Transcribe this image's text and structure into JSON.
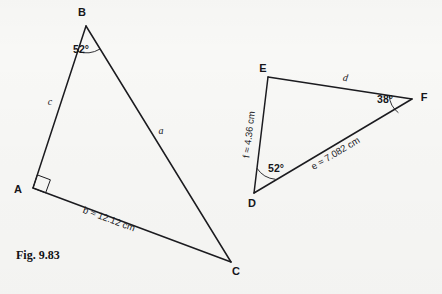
{
  "figure": {
    "caption": "Fig. 9.83",
    "background_color": "#f8f8f6",
    "ink_color": "#1b1b1f"
  },
  "triangle_abc": {
    "name": "triangle-abc",
    "vertices": {
      "A": {
        "label": "A",
        "x": 33,
        "y": 188
      },
      "B": {
        "label": "B",
        "x": 86,
        "y": 26
      },
      "C": {
        "label": "C",
        "x": 231,
        "y": 262
      }
    },
    "angles": {
      "at_B": "52°",
      "at_A": "90°"
    },
    "sides": {
      "a": {
        "label": "a",
        "note": "side opposite A, from B to C"
      },
      "b": {
        "symbol": "b",
        "relation": "≈",
        "value": "12.12",
        "unit": "cm",
        "full": "b ≈ 12.12 cm"
      },
      "c": {
        "label": "c",
        "note": "side opposite C, from A to B"
      }
    }
  },
  "triangle_def": {
    "name": "triangle-def",
    "vertices": {
      "D": {
        "label": "D",
        "x": 254,
        "y": 193
      },
      "E": {
        "label": "E",
        "x": 268,
        "y": 77
      },
      "F": {
        "label": "F",
        "x": 412,
        "y": 99
      }
    },
    "angles": {
      "at_D": "52°",
      "at_F": "38°"
    },
    "sides": {
      "d": {
        "label": "d",
        "note": "side opposite D, from E to F"
      },
      "e": {
        "symbol": "e",
        "relation": "≈",
        "value": "7.082",
        "unit": "cm",
        "full": "e ≈ 7.082 cm"
      },
      "f": {
        "symbol": "f",
        "relation": "≈",
        "value": "4.36",
        "unit": "cm",
        "full": "f ≈ 4.36 cm"
      }
    }
  }
}
